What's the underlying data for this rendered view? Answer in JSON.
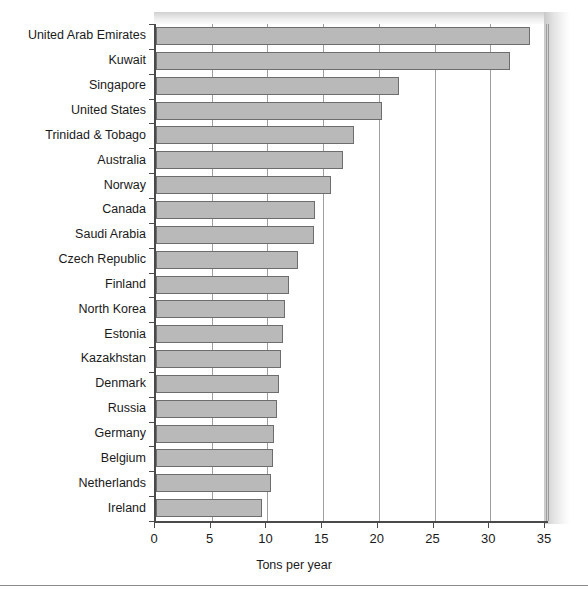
{
  "chart_data": {
    "type": "bar",
    "orientation": "horizontal",
    "title": "",
    "xlabel": "Tons per year",
    "ylabel": "",
    "xlim": [
      0,
      35
    ],
    "ylim": [
      0,
      20
    ],
    "grid": true,
    "legend": false,
    "bar_color": "#b9b9b9",
    "bar_edge_color": "#6d6d6d",
    "axis_color": "#4a4a4a",
    "xticks": [
      0,
      5,
      10,
      15,
      20,
      25,
      30,
      35
    ],
    "xtick_labels": [
      "0",
      "5",
      "10",
      "15",
      "20",
      "25",
      "30",
      "35"
    ],
    "categories": [
      "United Arab Emirates",
      "Kuwait",
      "Singapore",
      "United States",
      "Trinidad & Tobago",
      "Australia",
      "Norway",
      "Canada",
      "Saudi Arabia",
      "Czech Republic",
      "Finland",
      "North Korea",
      "Estonia",
      "Kazakhstan",
      "Denmark",
      "Russia",
      "Germany",
      "Belgium",
      "Netherlands",
      "Ireland"
    ],
    "values": [
      33.6,
      31.8,
      21.8,
      20.3,
      17.8,
      16.8,
      15.7,
      14.3,
      14.2,
      12.7,
      11.9,
      11.6,
      11.4,
      11.2,
      11.0,
      10.9,
      10.6,
      10.5,
      10.3,
      9.5
    ]
  }
}
